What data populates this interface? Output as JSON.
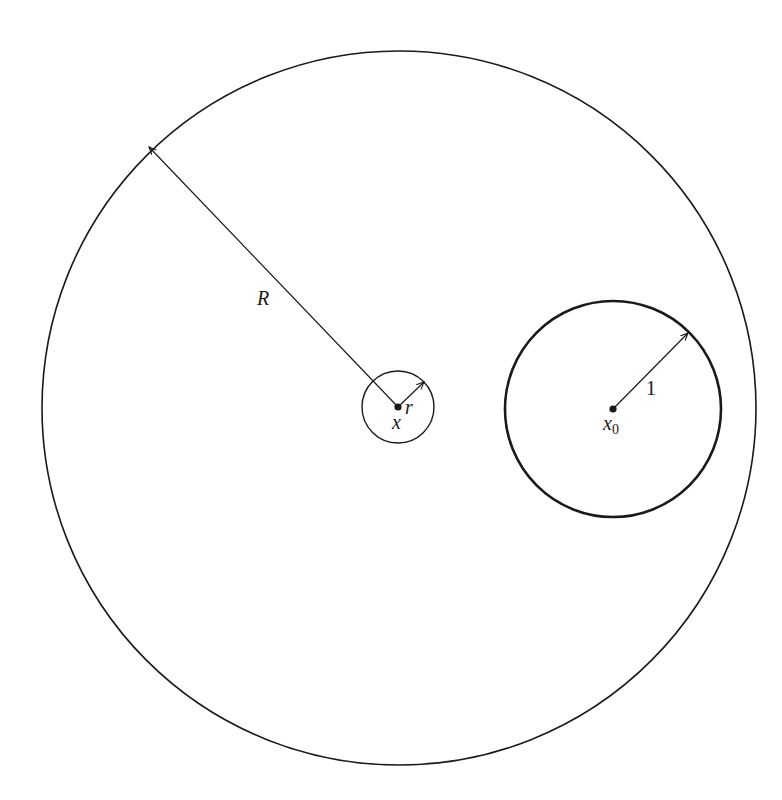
{
  "diagram": {
    "colors": {
      "stroke": "#1a1a1a",
      "background": "#ffffff"
    },
    "outer_circle": {
      "center": [
        399,
        408
      ],
      "radius": 357,
      "label": "R"
    },
    "small_circle": {
      "center": [
        398,
        407
      ],
      "radius": 36,
      "center_label": "x",
      "radius_label": "r"
    },
    "unit_circle": {
      "center": [
        613,
        409
      ],
      "radius": 108,
      "center_label": "x",
      "center_subscript": "0",
      "radius_label": "1"
    }
  }
}
